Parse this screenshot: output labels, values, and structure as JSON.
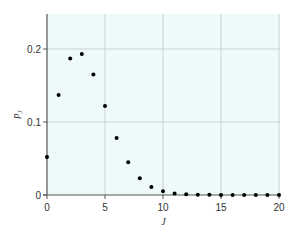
{
  "chart_data": {
    "type": "scatter",
    "title": "",
    "xlabel": "J",
    "ylabel": "p_J",
    "xlim": [
      0,
      20
    ],
    "ylim": [
      0,
      0.25
    ],
    "grid": true,
    "x_ticks": [
      0,
      5,
      10,
      15,
      20
    ],
    "x_tick_labels": [
      "0",
      "5",
      "10",
      "15",
      "20"
    ],
    "y_ticks": [
      0,
      0.1,
      0.2
    ],
    "y_tick_labels": [
      "0",
      "0.1",
      "0.2"
    ],
    "series": [
      {
        "name": "p_J",
        "x": [
          0,
          1,
          2,
          3,
          4,
          5,
          6,
          7,
          8,
          9,
          10,
          11,
          12,
          13,
          14,
          15,
          16,
          17,
          18,
          19,
          20
        ],
        "y": [
          0.052,
          0.137,
          0.187,
          0.193,
          0.165,
          0.122,
          0.078,
          0.045,
          0.023,
          0.011,
          0.005,
          0.002,
          0.001,
          0.0005,
          0.0002,
          0.0001,
          0,
          0,
          0,
          0,
          0
        ]
      }
    ],
    "colors": {
      "plot_background": "#eef9f9",
      "grid": "#c9d3d3",
      "axis": "#555555",
      "marker": "#000000"
    }
  }
}
